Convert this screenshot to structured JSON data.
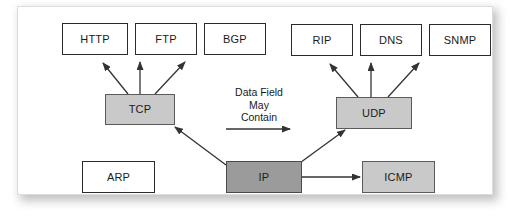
{
  "diagram": {
    "panel": {
      "background_color": "#ffffff",
      "border_color": "#dcdcdc"
    },
    "colors": {
      "application_box_fill": "#ffffff",
      "transport_box_fill": "#c9c9c9",
      "internet_box_fill": "#9b9b9b",
      "box_border": "#2b2b2b",
      "arrow_color": "#333333",
      "text_color": "#1a1a1a"
    },
    "application_nodes": [
      {
        "id": "http",
        "label": "HTTP",
        "fill": "white"
      },
      {
        "id": "ftp",
        "label": "FTP",
        "fill": "white"
      },
      {
        "id": "bgp",
        "label": "BGP",
        "fill": "white"
      },
      {
        "id": "rip",
        "label": "RIP",
        "fill": "white"
      },
      {
        "id": "dns",
        "label": "DNS",
        "fill": "white"
      },
      {
        "id": "snmp",
        "label": "SNMP",
        "fill": "white"
      }
    ],
    "transport_nodes": [
      {
        "id": "tcp",
        "label": "TCP",
        "fill": "gray"
      },
      {
        "id": "udp",
        "label": "UDP",
        "fill": "gray"
      },
      {
        "id": "icmp",
        "label": "ICMP",
        "fill": "gray"
      }
    ],
    "internet_nodes": [
      {
        "id": "ip",
        "label": "IP",
        "fill": "darkgray"
      },
      {
        "id": "arp",
        "label": "ARP",
        "fill": "white"
      }
    ],
    "annotations": [
      {
        "id": "data-field-note",
        "text": "Data Field\nMay\nContain"
      }
    ],
    "edges": [
      {
        "from": "tcp",
        "to": "http",
        "style": "arrow"
      },
      {
        "from": "tcp",
        "to": "ftp",
        "style": "arrow"
      },
      {
        "from": "tcp",
        "to": "bgp",
        "style": "arrow"
      },
      {
        "from": "udp",
        "to": "rip",
        "style": "arrow"
      },
      {
        "from": "udp",
        "to": "dns",
        "style": "arrow"
      },
      {
        "from": "udp",
        "to": "snmp",
        "style": "arrow"
      },
      {
        "from": "ip",
        "to": "tcp",
        "style": "arrow"
      },
      {
        "from": "ip",
        "to": "udp",
        "style": "arrow"
      },
      {
        "from": "ip",
        "to": "icmp",
        "style": "arrow"
      },
      {
        "from": "note",
        "to": "udp",
        "style": "arrow"
      }
    ]
  }
}
